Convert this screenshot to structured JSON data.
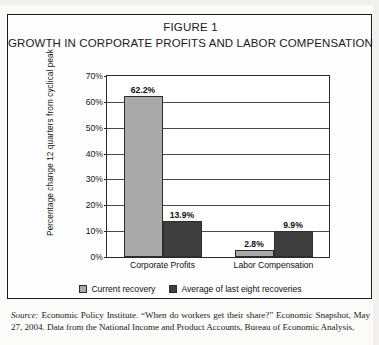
{
  "figure": {
    "title_line_1": "FIGURE 1",
    "title_line_2": "GROWTH IN CORPORATE PROFITS AND LABOR COMPENSATION"
  },
  "source": {
    "label": "Source:",
    "text": " Economic Policy Institute. “When do workers get their share?” Economic Snapshot, May 27, 2004. Data from the National Income and Product Accounts, Bureau of Economic Analysis,"
  },
  "chart_data": {
    "type": "bar",
    "title": "GROWTH IN CORPORATE PROFITS AND LABOR COMPENSATION",
    "xlabel": "",
    "ylabel": "Percentage change 12 quarters from cyclical peak",
    "ylim": [
      0,
      70
    ],
    "ytick_labels": [
      "70%",
      "60%",
      "50%",
      "40%",
      "30%",
      "20%",
      "10%",
      "0%"
    ],
    "ytick_values": [
      70,
      60,
      50,
      40,
      30,
      20,
      10,
      0
    ],
    "grid": true,
    "legend_position": "bottom",
    "categories": [
      "Corporate Profits",
      "Labor Compensation"
    ],
    "series": [
      {
        "name": "Current recovery",
        "color": "#a9a9a9",
        "values": [
          62.2,
          2.8
        ],
        "labels": [
          "62.2%",
          "2.8%"
        ]
      },
      {
        "name": "Average of last eight recoveries",
        "color": "#3e3e3e",
        "values": [
          13.9,
          9.9
        ],
        "labels": [
          "13.9%",
          "9.9%"
        ]
      }
    ]
  }
}
